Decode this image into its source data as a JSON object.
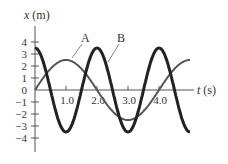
{
  "chart_data": {
    "type": "line",
    "title": "",
    "xlabel": "t (s)",
    "ylabel": "x (m)",
    "xlim": [
      0,
      5.0
    ],
    "ylim": [
      -4.5,
      4.5
    ],
    "x_ticks": [
      "1.0",
      "2.0",
      "3.0",
      "4.0"
    ],
    "y_ticks": [
      "4",
      "3",
      "2",
      "1",
      "0",
      "−1",
      "−2",
      "−3",
      "−4"
    ],
    "grid": false,
    "series": [
      {
        "name": "A",
        "function": "x = 2.5 sin(2πt/4)",
        "amplitude": 2.5,
        "period": 4.0,
        "t": [
          0,
          1.0,
          2.0,
          3.0,
          4.0,
          5.0
        ],
        "values": [
          0,
          2.5,
          0,
          -2.5,
          0,
          2.5
        ],
        "style": "thin"
      },
      {
        "name": "B",
        "function": "x = 3.5 cos(2πt/2)",
        "amplitude": 3.5,
        "period": 2.0,
        "t": [
          0,
          0.5,
          1.0,
          1.5,
          2.0,
          2.5,
          3.0,
          3.5,
          4.0,
          4.5,
          5.0
        ],
        "values": [
          3.5,
          0,
          -3.5,
          0,
          3.5,
          0,
          -3.5,
          0,
          3.5,
          0,
          -3.5
        ],
        "style": "thick"
      }
    ]
  },
  "labels": {
    "ylabel_var": "x",
    "ylabel_unit": " (m)",
    "xlabel_var": "t",
    "xlabel_unit": " (s)",
    "A": "A",
    "B": "B"
  }
}
